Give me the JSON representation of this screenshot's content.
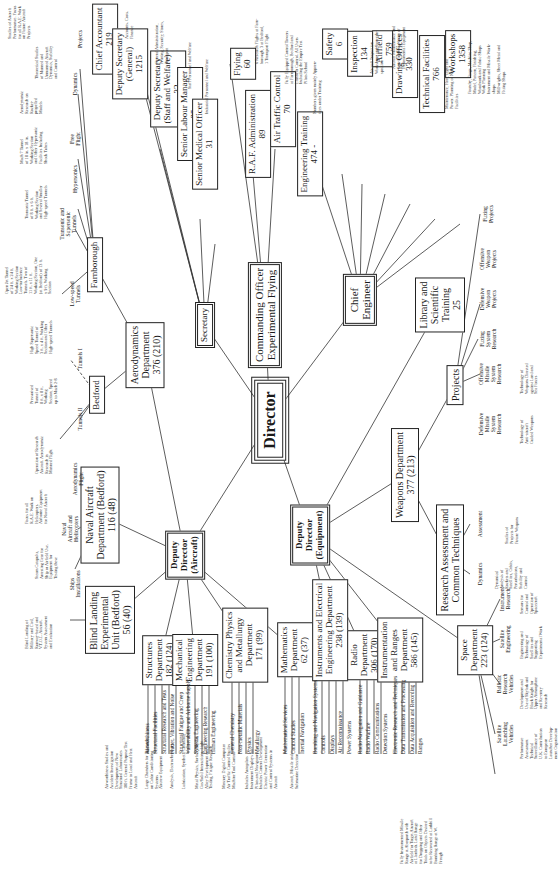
{
  "colors": {
    "ink": "#1a1a1a",
    "paper": "#ffffff"
  },
  "nodes": {
    "director": {
      "label": "Director"
    },
    "secretary": {
      "label": "Secretary"
    },
    "commanding_officer": {
      "line1": "Commanding Officer",
      "line2": "Experimental Flying"
    },
    "chief_engineer": {
      "line1": "Chief",
      "line2": "Engineer"
    },
    "dd_aircraft": {
      "line1": "Deputy",
      "line2": "Director",
      "line3": "(Aircraft)"
    },
    "dd_equipment": {
      "line1": "Deputy",
      "line2": "Director",
      "line3": "(Equipment)"
    },
    "weapons": {
      "line1": "Weapons Department",
      "line2": "377 (213)"
    },
    "research_assessment": {
      "line1": "Research Assessment and",
      "line2": "Common Techniques"
    },
    "projects": {
      "label": "Projects"
    },
    "library": {
      "line1": "Library and",
      "line2": "Scientific",
      "line3": "Training",
      "line4": "25"
    },
    "aerodynamics": {
      "line1": "Aerodynamics",
      "line2": "Department",
      "line3": "376 (210)"
    },
    "bedford": {
      "label": "Bedford"
    },
    "farnborough": {
      "label": "Farnborough"
    },
    "naval_aircraft": {
      "line1": "Naval Aircraft",
      "line2": "Department (Bedford)",
      "line3": "116 (48)"
    },
    "blind_landing": {
      "line1": "Blind Landing",
      "line2": "Experimental",
      "line3": "Unit (Bedford)",
      "line4": "56 (40)"
    },
    "structures": {
      "line1": "Structures",
      "line2": "Department",
      "line3": "182 (124)"
    },
    "mechanical": {
      "line1": "Mechanical",
      "line2": "Engineering",
      "line3": "Department",
      "line4": "191 (100)"
    },
    "chemistry": {
      "line1": "Chemistry Physics",
      "line2": "and Metallurgy",
      "line3": "Department",
      "line4": "171 (99)"
    },
    "mathematics": {
      "line1": "Mathematics",
      "line2": "Department",
      "line3": "62 (37)"
    },
    "instruments": {
      "line1": "Instruments and Electrical",
      "line2": "Engineering Department",
      "line3": "238 (139)"
    },
    "radio": {
      "line1": "Radio",
      "line2": "Department",
      "line3": "306 (170)"
    },
    "instrumentation": {
      "line1": "Instrumentation",
      "line2": "and Ranges",
      "line3": "Department",
      "line4": "586 (145)"
    },
    "space": {
      "line1": "Space",
      "line2": "Department",
      "line3": "223 (124)"
    },
    "chief_accountant": {
      "line1": "Chief Accountant",
      "line2": "219"
    },
    "deputy_sec_general": {
      "line1": "Deputy Secretary",
      "line2": "(General)",
      "line3": "1215"
    },
    "deputy_sec_staff": {
      "line1": "Deputy Secretary",
      "line2": "(Staff and Welfare)",
      "line3": "32"
    },
    "senior_labour": {
      "line1": "Senior Labour Manager",
      "line2": "25"
    },
    "senior_medical": {
      "line1": "Senior Medical Officer",
      "line2": "31"
    },
    "flying": {
      "line1": "Flying",
      "line2": "60"
    },
    "raf_admin": {
      "line1": "R.A.F. Administration",
      "line2": "89"
    },
    "air_traffic": {
      "line1": "Air Traffic Control",
      "line2": "70"
    },
    "eng_training": {
      "line1": "Engineering Training",
      "line2": "474 -"
    },
    "safety": {
      "line1": "Safety",
      "line2": "6"
    },
    "inspection": {
      "line1": "Inspection",
      "line2": "134"
    },
    "airfield": {
      "line1": "Airfield",
      "line2": "759"
    },
    "drawing": {
      "line1": "Drawing Offices",
      "line2": "330"
    },
    "technical": {
      "line1": "Technical Facilities",
      "line2": "766"
    },
    "workshops": {
      "line1": "Workshops",
      "line2": "1358"
    }
  },
  "labels": {
    "hypersonics": "Hypersonics",
    "free_flight": "Free\nFlight",
    "dynamics_top": "Dynamics",
    "projects_top": "Projects",
    "transonic": "Transonic and\nSupersonic\nTunnels",
    "low_speed": "Low-speed\nTunnels",
    "tunnels_1": "Tunnels I",
    "tunnels_2": "Tunnels II",
    "aero_flight": "Aerodynamics\nFlight",
    "naval_heli": "Naval\nAircraft and\nHelicopters",
    "ships": "Ships\nInstallations",
    "fuzing_projects": "Fuzing\nProjects",
    "offensive_weapon": "Offensive\nWeapon\nProjects",
    "defensive_weapon": "Defensive\nWeapon\nProjects",
    "fuzing_research": "Fuzing\nSystem\nResearch",
    "offensive_missile": "Offensive\nMissile\nSystem\nResearch",
    "defensive_missile": "Defensive\nMissile\nSystem\nResearch",
    "assessment": "Assessment",
    "dynamics_ra": "Dynamics",
    "instrument_research": "Instrument\nResearch",
    "satellite_eng": "Satellite\nEngineering",
    "ballistic": "Ballistic\nResearch\nVehicles",
    "satellite_launch": "Satellite\nLaunching\nVehicles"
  },
  "notes": {
    "aero_projects": "Studies of Aircraft\nPerformance. Focus\nfor all R.A.E. Work\non Future Aircraft\nProjects",
    "theoretical": "Theoretical Studies\nof Manned and\nUnmanned Aircraft\nDynamics, Stability\nand Control",
    "aerodynamic_research": "Aerodynamic\nResearch on\nRocket-\npropelled\nModels",
    "mach7": "Mach 7 Tunnel\nof 18 in. x 18 in.\nWorking Section\nand Other Hypersonic\nFacilities Including\nShock Tubes",
    "transonic_tunnel": "Transonic Tunnel\nof 8 ft. x 6 ft.\nWorking Section\nand Several Smaller\nHigh-speed Tunnels",
    "open_jet": "Open Jet Tunnel\nof 24 ft. x 24 ft.\nWorking Section\nLow-turbulence\nTunnels. Two of\n11 ft. x 11 ft.\nWorking Section, One\n(at Bedford) of 13 ft.\nx 9 ft. Working\nSection",
    "high_supersonic": "High Supersonic\nSpeed Tunnel of\n3 ft. x 4 ft. Working\nSection and Other\nHigh-speed Tunnels",
    "pressurised": "Pressurised\nTunnel of\n8 ft. x 8 ft.\nWorking\nSection, Speed\nup to Mach 2-8",
    "operation_research": "Operation of Research\nAircraft. Aerodynamic\nResearch in\nManned Flight",
    "focus_naval": "Focus for all\nR.A.E. Work on\nHelicopters.\nAirborne Equipment\nfor Naval Aircraft",
    "steam_catapults": "Steam Catapults,\nArresting Gear for\nShip or Airfield Use.\nEquipment for\nTesting these",
    "blind_landing_note": "Blind Landing of\nMilitary and Civil,\nRunway-based and\nV.T.O.L. Aircraft.\nSystem Assessment\nand Evaluation",
    "accounts": "Accounts. Costs. Finance",
    "general_admin": "General Administration,\nPrinting, Security, Stores,\nTransport",
    "staff_personnel": "Staff Personnel and Welfare",
    "industrial_personnel": "Industrial Personnel and Welfare",
    "research_flights": "6 Research Flights at Farn-\nborough, 3 at Bedford,\n1 Transport Flight",
    "control_towers": "Fully Equipped Control Towers\nat Farnborough, Bedford and\nLlanbedr Control. All Users\nIncluding the Empire Test\nPilots School",
    "apprentices": "Numbers given mainly Appren-\ntices under Training",
    "inspection_note": "Aircraft Inspection\nWorkshops and Stores In-\nspection",
    "airfield_note": "Aircraft Maintenance and\nServicing Installation of\nExperimental Equipment",
    "technical_note": "Maintenance, Heat, Light and\nPower. Planning of New\nFacilities",
    "workshops_note": "Foundry, Forge, Machine Shop,\nModel, Pattern, Finishing,\nWoodwork and Fabric Shops\nWork Planning\nInstrument and Missile Work-\nshops\nMillwrights, Sheet Metal and\nFitting Shops",
    "weapons_land_sea": "Technology of\nWeapons Directed\nagainst Land and\nSea Forces",
    "anti_aircraft": "Technology of\nAnti-aircraft\nGuided Weapons",
    "future_weapons": "Studies of\nProjects for\nFuture Weapons",
    "dynamical_analysis": "Dynamical\nAnalysis of\nRockets and\nSatellites, Orbits,\nPerturbations,\nStability and\nControl",
    "sensors": "Sensors for\nControl and\nOperation of\nSpacecraft",
    "eng_tech": "Engineering and\nTechnology of\nSatellites and\nSupporting\nExperimental Work",
    "skylark": "Development and\nUse of Skylark and\nBlack Knight for\nUpper Atmosphere\nand Re-entry\nResearch",
    "performance": "Performance\nAssessment\nTechnical\nSurveillance of\nU.K. Contribution\nto European\nLauncher Develop-\nment Organisation",
    "airworthiness_note": "Airworthiness Studies and\nAccident Investigation\nDevelopment of New\nStructural Laboratories\n100 ft. General Purpose Test\nFrame to Load and Heat\nAircraft",
    "large_chambers": "Large Chambers for Research\non Cabin Conditioning\nSystems\nAircrew Equipment",
    "analysis": "Analysis, Electrochemistry",
    "lubrication": "Lubrication, Synthetic Chemistry",
    "metal_physics": "Metal Physics, Surface Physics,\nGas/Solid Interactions, Light\nAlloy Development and\nTesting, Fatigue Research",
    "mercury": "Mercury Digital Computer\nAir Traffic Control Studies\nMachine Tool Control",
    "autopilots": "Includes Autopilots\nInstrument Displays for\nPilots and Navigators\nIncludes Camera Development\nElectric Power Generation\nand Control Systems in\nAircraft",
    "aircraft_missile": "Aircraft, Missile and\nSubmarine Detection",
    "ranges_note": "Fully Instrumented Missile\nRange at Aberporth with\nAirfield for Target Aircraft\nat Llanbedr. Land Range\nfor Dropping and Other\nTrials on Objects Desired\nto be Recovered at Larkhill\nBombing Range at W.\nFreugh"
  },
  "sublists": {
    "structures": [
      "Airworthiness",
      "Structural Facilities",
      "Structural Research and Tests",
      "Flutter, Vibration and Noise",
      "Structural Fatigue and Creep"
    ],
    "mechanical": [
      "Vulnerability and Airborne Supply",
      "Systems Engineering",
      "Engineering Research",
      "Human Engineering"
    ],
    "chemistry": [
      "General Chemistry",
      "Non-metallic Materials",
      "Physics",
      "Metallurgy"
    ],
    "mathematics": [
      "Mathematical Services",
      "Control Studies",
      "Inertial Navigation"
    ],
    "instruments": [
      "Bombing and Navigation Systems",
      "Controls",
      "Displays",
      "Air Reconnaissance",
      "Power Systems"
    ],
    "radio": [
      "Radio Navigation and Guidance",
      "Radio Warfare",
      "Radio Communications",
      "Detection Systems"
    ],
    "instrumentation": [
      "Electronic Research and Techniques",
      "Data Transmission and Processing",
      "Data Acquisition and Recording",
      "Ranges"
    ]
  }
}
